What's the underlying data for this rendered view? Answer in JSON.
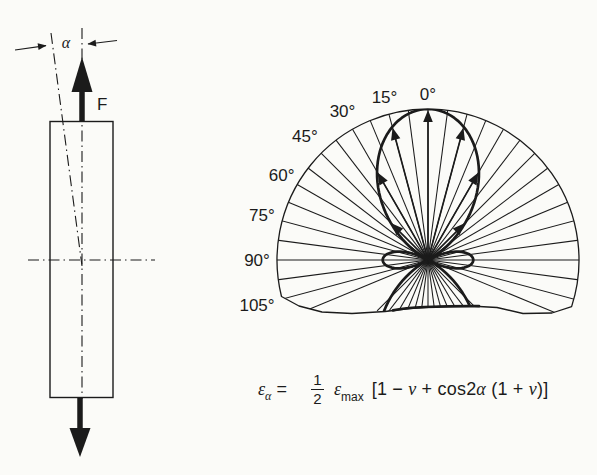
{
  "figure": {
    "background": "#fbfbf8",
    "ink": "#1b1b1b"
  },
  "bar_diagram": {
    "alpha_label": "α",
    "force_label": "F"
  },
  "polar_plot": {
    "angle_labels": [
      {
        "angle": 0,
        "text": "0°"
      },
      {
        "angle": 15,
        "text": "15°"
      },
      {
        "angle": 30,
        "text": "30°"
      },
      {
        "angle": 45,
        "text": "45°"
      },
      {
        "angle": 60,
        "text": "60°"
      },
      {
        "angle": 75,
        "text": "75°"
      },
      {
        "angle": 90,
        "text": "90°"
      },
      {
        "angle": 105,
        "text": "105°"
      }
    ],
    "ray_step_deg": 7.5,
    "ray_min_deg": -112.5,
    "ray_max_deg": 112.5,
    "through_center_max_deg": 45,
    "arrow_angles_deg": [
      0,
      15,
      -15,
      30,
      -30,
      45,
      -45
    ],
    "poisson_ratio_used": 0.3
  },
  "formula": {
    "lhs_symbol": "ε",
    "lhs_subscript": "α",
    "equals_sign": "=",
    "fraction_numerator": "1",
    "fraction_denominator": "2",
    "coefficient_symbol": "ε",
    "coefficient_subscript": "max",
    "bracket_open": "[1 − ",
    "nu_1": "ν",
    "middle_text": " + cos2",
    "alpha_symbol": "α",
    "paren_text": " (1 + ",
    "nu_2": "ν",
    "bracket_close": ")]"
  }
}
